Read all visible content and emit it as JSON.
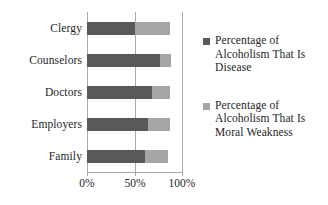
{
  "chart_data": {
    "type": "bar",
    "orientation": "horizontal",
    "stacked": true,
    "title": "",
    "subtitle": "",
    "xlabel": "",
    "ylabel": "",
    "categories": [
      "Clergy",
      "Counselors",
      "Doctors",
      "Employers",
      "Family"
    ],
    "series": [
      {
        "name": "Percentage of Alcoholism That Is Disease",
        "legend_label_lines": [
          "Percentage of",
          "Alcoholism That",
          "Is Disease"
        ],
        "color": "#595959",
        "values": [
          50,
          76,
          68,
          64,
          60
        ]
      },
      {
        "name": "Percentage of Alcoholism That Is Moral Weakness",
        "legend_label_lines": [
          "Percentage of",
          "Alcoholism That",
          "Is Moral",
          "Weakness"
        ],
        "color": "#a6a6a6",
        "values": [
          36,
          12,
          18,
          22,
          24
        ]
      }
    ],
    "totals": [
      86,
      88,
      86,
      86,
      84
    ],
    "xlim": [
      0,
      100
    ],
    "xticks": [
      0,
      50,
      100
    ],
    "xtick_labels": [
      "0%",
      "50%",
      "100%"
    ],
    "grid": true,
    "gridlines_x": [
      0,
      50,
      100
    ],
    "legend_position": "right",
    "axis_color": "#a9a9a9",
    "text_color": "#262626",
    "background": "#ffffff"
  },
  "axis": {
    "tick_labels": [
      "0%",
      "50%",
      "100%"
    ]
  },
  "categories": [
    "Clergy",
    "Counselors",
    "Doctors",
    "Employers",
    "Family"
  ],
  "legend": {
    "items": [
      {
        "label": "Percentage of Alcoholism That Is Disease",
        "lines": [
          "Percentage of",
          "Alcoholism That",
          "Is Disease"
        ],
        "color": "#595959"
      },
      {
        "label": "Percentage of Alcoholism That Is Moral Weakness",
        "lines": [
          "Percentage of",
          "Alcoholism That",
          "Is Moral",
          "Weakness"
        ],
        "color": "#a6a6a6"
      }
    ]
  }
}
